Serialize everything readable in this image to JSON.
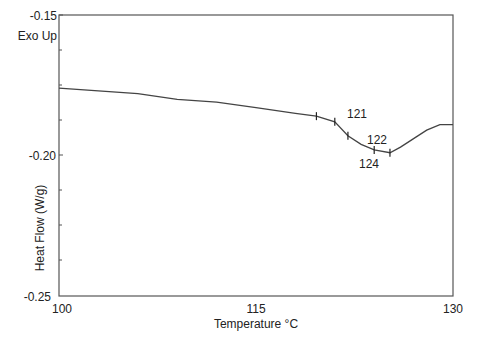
{
  "chart_data": {
    "type": "line",
    "title": "",
    "annotation_top_left": "Exo Up",
    "xlabel": "Temperature °C",
    "ylabel": "Heat Flow (W/g)",
    "xlim": [
      100,
      130
    ],
    "ylim": [
      -0.25,
      -0.15
    ],
    "x_ticks": [
      100,
      115,
      130
    ],
    "x_tick_labels": [
      "100",
      "115",
      "130"
    ],
    "y_ticks": [
      -0.25,
      -0.2,
      -0.15
    ],
    "y_tick_labels": [
      "-0.25",
      "-0.20",
      "-0.15"
    ],
    "grid": false,
    "legend": null,
    "series": [
      {
        "name": "DSC heat flow",
        "color": "#444444",
        "x": [
          100,
          103,
          106,
          109,
          112,
          115,
          118,
          119.6,
          121,
          122,
          123,
          124,
          125.2,
          126,
          127,
          128,
          129,
          130
        ],
        "y": [
          -0.176,
          -0.177,
          -0.178,
          -0.18,
          -0.181,
          -0.183,
          -0.185,
          -0.186,
          -0.188,
          -0.193,
          -0.196,
          -0.198,
          -0.199,
          -0.197,
          -0.194,
          -0.191,
          -0.189,
          -0.189
        ]
      }
    ],
    "markers": [
      {
        "x": 119.6,
        "y": -0.186,
        "label": ""
      },
      {
        "x": 121,
        "y": -0.188,
        "label": "121"
      },
      {
        "x": 122,
        "y": -0.193,
        "label": "122"
      },
      {
        "x": 124,
        "y": -0.198,
        "label": "124"
      },
      {
        "x": 125.2,
        "y": -0.199,
        "label": ""
      }
    ]
  },
  "labels": {
    "exo_up": "Exo Up",
    "y_top": "-0.15",
    "y_mid": "-0.20",
    "y_bottom": "-0.25",
    "x_left": "100",
    "x_mid": "115",
    "x_right": "130",
    "x_axis_title": "Temperature °C",
    "y_axis_title": "Heat Flow (W/g)",
    "marker_121": "121",
    "marker_122": "122",
    "marker_124": "124"
  }
}
